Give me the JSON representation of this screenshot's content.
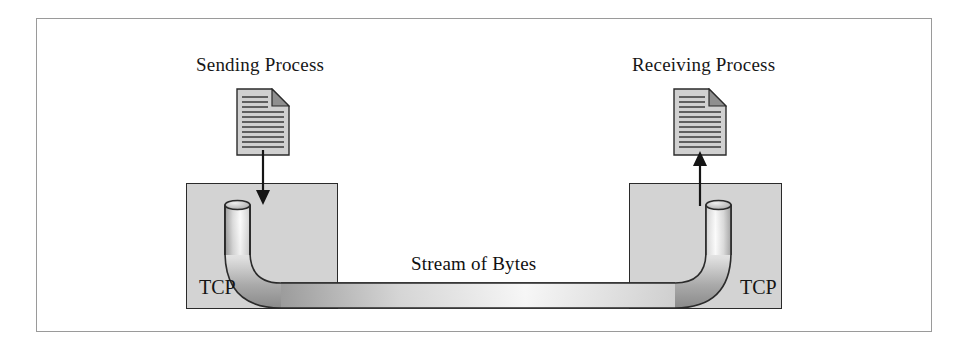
{
  "figure": {
    "type": "diagram",
    "background_color": "#ffffff",
    "frame_border_color": "#9a9a9a"
  },
  "labels": {
    "sending_process": "Sending Process",
    "receiving_process": "Receiving Process",
    "stream_of_bytes": "Stream of Bytes",
    "tcp_left": "TCP",
    "tcp_right": "TCP"
  },
  "icons": {
    "sending_document": "document-page-icon",
    "receiving_document": "document-page-icon",
    "arrow_into_tcp": "arrow-down-icon",
    "arrow_out_of_tcp": "arrow-up-icon",
    "pipe": "pipe-conduit-shape"
  },
  "boxes": [
    {
      "name": "tcp-left",
      "label": "TCP",
      "fill": "#d3d3d3",
      "stroke": "#2a2a2a"
    },
    {
      "name": "tcp-right",
      "label": "TCP",
      "fill": "#d3d3d3",
      "stroke": "#2a2a2a"
    }
  ],
  "colors": {
    "box_fill": "#d3d3d3",
    "box_stroke": "#2a2a2a",
    "pipe_light": "#fbfbfb",
    "pipe_mid": "#c9c9c9",
    "pipe_dark": "#8e8e8e",
    "pipe_outline": "#2b2b2b",
    "text": "#141414",
    "arrow": "#151515"
  }
}
